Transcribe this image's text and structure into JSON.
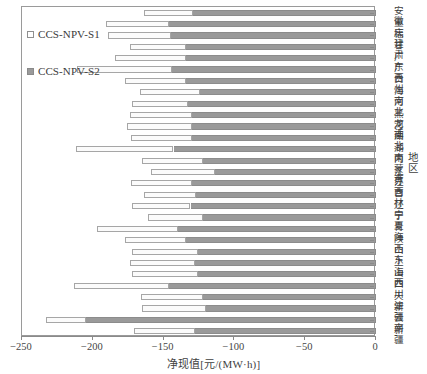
{
  "chart": {
    "type": "bar",
    "title": "",
    "xlabel": "净现值[元/(MW·h)]",
    "ylabel": "地区",
    "xlim": [
      -250,
      0
    ],
    "xticks": [
      -250,
      -200,
      -150,
      -100,
      -50,
      0
    ],
    "xtick_labels": [
      "−250",
      "−200",
      "−150",
      "−100",
      "−50",
      "0"
    ],
    "orientation": "horizontal",
    "grid": false,
    "legend_position": "upper-left",
    "series_names": [
      "CCS-NPV-S1",
      "CCS-NPV-S2"
    ],
    "colors": {
      "s1": "#ffffff",
      "s2": "#9a9a9a",
      "edge": "#8f8f8f",
      "axis": "#8a8a8a"
    },
    "legend": [
      {
        "label": "CCS-NPV-S1",
        "swatch": "s1"
      },
      {
        "label": "CCS-NPV-S2",
        "swatch": "s2"
      }
    ]
  },
  "chart_data": {
    "type": "bar",
    "title": "",
    "xlabel": "净现值[元/(MW·h)]",
    "ylabel": "地区",
    "xlim": [
      -250,
      0
    ],
    "xticks": [
      -250,
      -200,
      -150,
      -100,
      -50,
      0
    ],
    "grid": false,
    "legend": [
      "CCS-NPV-S1",
      "CCS-NPV-S2"
    ],
    "legend_position": "upper-left",
    "orientation": "horizontal",
    "note": "Each region draws a floating bar from CCS-NPV-S1 (more negative, hollow/white segment) to 0; the gray segment spans from CCS-NPV-S2 to 0.",
    "categories": [
      "安徽",
      "重庆",
      "福建",
      "甘肃",
      "广东",
      "广西",
      "贵州",
      "海南",
      "河北",
      "黑龙江",
      "河南",
      "湖北",
      "湖南",
      "内蒙古",
      "江苏",
      "江西",
      "吉林",
      "辽宁",
      "宁夏",
      "青海",
      "陕西",
      "山东",
      "上海",
      "山西",
      "四川",
      "天津",
      "新疆",
      "云南",
      "新疆"
    ],
    "series": [
      {
        "name": "CCS-NPV-S1",
        "values": [
          -164,
          -191,
          -189,
          -174,
          -184,
          -211,
          -177,
          -167,
          -172,
          -174,
          -176,
          -173,
          -212,
          -165,
          -159,
          -173,
          -164,
          -172,
          -161,
          -197,
          -177,
          -172,
          -174,
          -172,
          -213,
          -166,
          -165,
          -233,
          -171
        ]
      },
      {
        "name": "CCS-NPV-S2",
        "values": [
          -129,
          -146,
          -145,
          -134,
          -134,
          -144,
          -134,
          -124,
          -133,
          -130,
          -130,
          -130,
          -143,
          -122,
          -114,
          -130,
          -127,
          -131,
          -122,
          -140,
          -134,
          -126,
          -128,
          -126,
          -146,
          -122,
          -120,
          -205,
          -128
        ]
      }
    ]
  }
}
